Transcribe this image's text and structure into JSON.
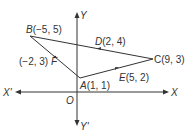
{
  "figure": {
    "type": "coordinate-geometry-triangle",
    "axes": {
      "x_positive_label": "X",
      "x_negative_label": "X'",
      "y_positive_label": "Y",
      "y_negative_label": "Y'",
      "origin_label": "O"
    },
    "vertices": [
      {
        "name": "A",
        "coords": "(1, 1)",
        "label": "A(1, 1)"
      },
      {
        "name": "B",
        "coords": "(−5, 5)",
        "label": "B(−5, 5)"
      },
      {
        "name": "C",
        "coords": "(9, 3)",
        "label": "C(9, 3)"
      }
    ],
    "midpoints": [
      {
        "name": "D",
        "coords": "(2, 4)",
        "label_name": "D",
        "label_coords": "(2, 4)",
        "on_side": "BC"
      },
      {
        "name": "E",
        "coords": "(5, 2)",
        "label_name": "E",
        "label_coords": "(5, 2)",
        "on_side": "AC"
      },
      {
        "name": "F",
        "coords": "(−2, 3)",
        "label_name": "F",
        "label_coords": "(−2, 3)",
        "on_side": "AB"
      }
    ],
    "colors": {
      "line": "#333333",
      "text": "#333333",
      "background": "#ffffff"
    }
  }
}
